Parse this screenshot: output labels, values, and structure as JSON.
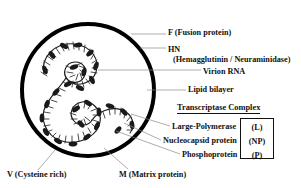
{
  "figure": {
    "background_color": "#ffffff",
    "text_color": "#111111",
    "leader_line_color": "#8a8a8a",
    "envelope_color": "#000000",
    "f_spike_color": "#9a9a9a",
    "hn_spike_color": "#000000"
  },
  "labels": {
    "f_protein": "F (Fusion protein)",
    "hn_protein": "HN",
    "hn_protein_sub": "(Hemagglutinin / Neuraminidase)",
    "virion_rna": "Virion RNA",
    "lipid_bilayer": "Lipid bilayer",
    "transcriptase_complex": "Transcriptase Complex",
    "large_polymerase": "Large-Polymerase",
    "nucleocapsid_protein": "Nucleocapsid protein",
    "phosphoprotein": "Phosphoprotein",
    "v_protein": "V (Cysteine rich)",
    "m_protein": "M (Matrix protein)"
  },
  "abbreviations": {
    "large_polymerase": "(L)",
    "nucleocapsid_protein": "(NP)",
    "phosphoprotein": "(P)"
  },
  "structure": {
    "envelope_center_x": 88,
    "envelope_center_y": 90,
    "envelope_radius": 66,
    "envelope_stroke_width": 4,
    "hn_spike_count": 22,
    "f_spike_count": 20,
    "nucleocapsid_description": "coiled helical ribonucleoprotein with teardrop-shaped proteins"
  }
}
